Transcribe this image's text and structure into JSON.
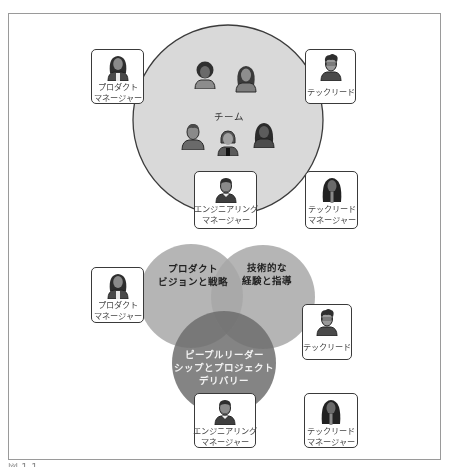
{
  "colors": {
    "team_circle_fill": "#d9d9d9",
    "team_circle_stroke": "#3c3c3c",
    "venn_product_fill": "#a6a6a6",
    "venn_tech_fill": "#a6a6a6",
    "venn_people_fill": "#7a7a7a",
    "card_border": "#3a3a3a"
  },
  "top_diagram": {
    "team_label": "チーム",
    "team_members": [
      {
        "icon": "person-afro-icon"
      },
      {
        "icon": "person-long-hair-icon"
      },
      {
        "icon": "person-short-hair-icon"
      },
      {
        "icon": "person-bob-hair-icon"
      },
      {
        "icon": "person-dark-hair-icon"
      }
    ],
    "cards": {
      "product_manager": {
        "line1": "プロダクト",
        "line2": "マネージャー"
      },
      "tech_lead": {
        "line1": "テックリード"
      },
      "engineering_manager": {
        "line1": "エンジニアリング",
        "line2": "マネージャー"
      },
      "tech_lead_manager": {
        "line1": "テックリード",
        "line2": "マネージャー"
      }
    }
  },
  "bottom_diagram": {
    "venn": {
      "product": {
        "line1": "プロダクト",
        "line2": "ビジョンと戦略"
      },
      "tech": {
        "line1": "技術的な",
        "line2": "経験と指導"
      },
      "people": {
        "line1": "ピープルリーダー",
        "line2": "シップとプロジェクト",
        "line3": "デリバリー"
      }
    },
    "cards": {
      "product_manager": {
        "line1": "プロダクト",
        "line2": "マネージャー"
      },
      "tech_lead": {
        "line1": "テックリード"
      },
      "engineering_manager": {
        "line1": "エンジニアリング",
        "line2": "マネージャー"
      },
      "tech_lead_manager": {
        "line1": "テックリード",
        "line2": "マネージャー"
      }
    }
  },
  "caption": "図 1-1 ..."
}
